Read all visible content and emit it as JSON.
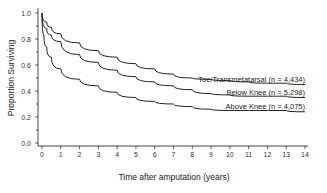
{
  "chart_data": {
    "type": "line",
    "title": "",
    "xlabel": "Time after amputation (years)",
    "ylabel": "Proportion Surviving",
    "xlim": [
      0,
      14
    ],
    "ylim": [
      0.0,
      1.0
    ],
    "x_ticks": [
      "0",
      "1",
      "2",
      "3",
      "4",
      "5",
      "6",
      "7",
      "8",
      "9",
      "10",
      "11",
      "12",
      "13",
      "14"
    ],
    "y_ticks": [
      "0.0",
      "0.2",
      "0.4",
      "0.6",
      "0.8",
      "1.0"
    ],
    "grid": false,
    "legend_position": "inline labels at right end of curves",
    "series": [
      {
        "name": "Toe/Transmetatarsal (n = 4,434)",
        "x": [
          0,
          0.25,
          0.5,
          1,
          2,
          3,
          4,
          5,
          6,
          7,
          8,
          9,
          10,
          11,
          12,
          13,
          14
        ],
        "values": [
          1.0,
          0.93,
          0.89,
          0.84,
          0.77,
          0.71,
          0.66,
          0.61,
          0.57,
          0.53,
          0.5,
          0.49,
          0.48,
          0.47,
          0.46,
          0.46,
          0.45
        ]
      },
      {
        "name": "Below Knee (n = 5,298)",
        "x": [
          0,
          0.25,
          0.5,
          1,
          2,
          3,
          4,
          5,
          6,
          7,
          8,
          9,
          10,
          11,
          12,
          13,
          14
        ],
        "values": [
          1.0,
          0.88,
          0.83,
          0.78,
          0.68,
          0.62,
          0.56,
          0.51,
          0.47,
          0.44,
          0.41,
          0.38,
          0.37,
          0.36,
          0.36,
          0.36,
          0.35
        ]
      },
      {
        "name": "Above Knee (n = 4,075)",
        "x": [
          0,
          0.1,
          0.25,
          0.5,
          1,
          2,
          3,
          4,
          5,
          6,
          7,
          8,
          9,
          10,
          11,
          12,
          13,
          14
        ],
        "values": [
          1.0,
          0.83,
          0.74,
          0.66,
          0.57,
          0.49,
          0.44,
          0.39,
          0.35,
          0.32,
          0.3,
          0.28,
          0.26,
          0.25,
          0.25,
          0.25,
          0.25,
          0.24
        ]
      }
    ]
  }
}
